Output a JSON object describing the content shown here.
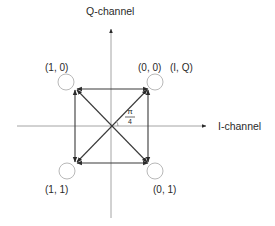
{
  "diagram": {
    "type": "QPSK constellation diagram",
    "axes": {
      "vertical_label": "Q-channel",
      "horizontal_label": "I-channel"
    },
    "points": [
      {
        "id": "top-left",
        "label": "(1, 0)"
      },
      {
        "id": "top-right",
        "label": "(0, 0)"
      },
      {
        "id": "bottom-left",
        "label": "(1, 1)"
      },
      {
        "id": "bottom-right",
        "label": "(0, 1)"
      }
    ],
    "legend_label": "(I, Q)",
    "angle": {
      "numerator": "π",
      "denominator": "4"
    },
    "colors": {
      "axis": "#9a9a9a",
      "arrow": "#3a3a3a",
      "circle": "#b0b0b0",
      "text": "#2a2a2a"
    }
  }
}
